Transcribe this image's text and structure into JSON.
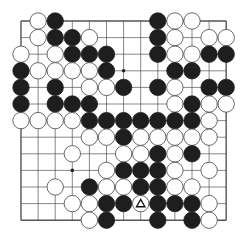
{
  "board": {
    "size": 13,
    "origin_x": 21,
    "origin_y": 21,
    "spacing_x": 17.1,
    "spacing_y": 16.6,
    "stone_radius": 8.2,
    "colors": {
      "line": "#555555",
      "black": "#1e1e1e",
      "white": "#ffffff",
      "white_stroke": "#444444",
      "background": "#ffffff"
    },
    "star_points": [
      [
        3,
        6
      ],
      [
        9,
        3
      ]
    ],
    "marked": {
      "row": 11,
      "col": 7,
      "mark": "triangle"
    },
    "stones": [
      {
        "r": 0,
        "c": 1,
        "color": "W"
      },
      {
        "r": 0,
        "c": 2,
        "color": "B"
      },
      {
        "r": 0,
        "c": 8,
        "color": "B"
      },
      {
        "r": 0,
        "c": 9,
        "color": "W"
      },
      {
        "r": 0,
        "c": 10,
        "color": "W"
      },
      {
        "r": 1,
        "c": 1,
        "color": "W"
      },
      {
        "r": 1,
        "c": 2,
        "color": "B"
      },
      {
        "r": 1,
        "c": 3,
        "color": "B"
      },
      {
        "r": 1,
        "c": 4,
        "color": "W"
      },
      {
        "r": 1,
        "c": 8,
        "color": "B"
      },
      {
        "r": 1,
        "c": 9,
        "color": "W"
      },
      {
        "r": 1,
        "c": 11,
        "color": "W"
      },
      {
        "r": 1,
        "c": 12,
        "color": "W"
      },
      {
        "r": 2,
        "c": 0,
        "color": "W"
      },
      {
        "r": 2,
        "c": 2,
        "color": "W"
      },
      {
        "r": 2,
        "c": 3,
        "color": "B"
      },
      {
        "r": 2,
        "c": 4,
        "color": "B"
      },
      {
        "r": 2,
        "c": 5,
        "color": "B"
      },
      {
        "r": 2,
        "c": 8,
        "color": "B"
      },
      {
        "r": 2,
        "c": 9,
        "color": "W"
      },
      {
        "r": 2,
        "c": 10,
        "color": "W"
      },
      {
        "r": 2,
        "c": 11,
        "color": "B"
      },
      {
        "r": 2,
        "c": 12,
        "color": "B"
      },
      {
        "r": 3,
        "c": 0,
        "color": "B"
      },
      {
        "r": 3,
        "c": 1,
        "color": "W"
      },
      {
        "r": 3,
        "c": 2,
        "color": "W"
      },
      {
        "r": 3,
        "c": 3,
        "color": "W"
      },
      {
        "r": 3,
        "c": 4,
        "color": "W"
      },
      {
        "r": 3,
        "c": 5,
        "color": "B"
      },
      {
        "r": 3,
        "c": 9,
        "color": "B"
      },
      {
        "r": 3,
        "c": 10,
        "color": "B"
      },
      {
        "r": 4,
        "c": 0,
        "color": "B"
      },
      {
        "r": 4,
        "c": 2,
        "color": "B"
      },
      {
        "r": 4,
        "c": 4,
        "color": "W"
      },
      {
        "r": 4,
        "c": 5,
        "color": "W"
      },
      {
        "r": 4,
        "c": 6,
        "color": "B"
      },
      {
        "r": 4,
        "c": 8,
        "color": "B"
      },
      {
        "r": 4,
        "c": 9,
        "color": "W"
      },
      {
        "r": 4,
        "c": 11,
        "color": "B"
      },
      {
        "r": 4,
        "c": 12,
        "color": "B"
      },
      {
        "r": 5,
        "c": 0,
        "color": "B"
      },
      {
        "r": 5,
        "c": 2,
        "color": "B"
      },
      {
        "r": 5,
        "c": 3,
        "color": "B"
      },
      {
        "r": 5,
        "c": 4,
        "color": "B"
      },
      {
        "r": 5,
        "c": 9,
        "color": "W"
      },
      {
        "r": 5,
        "c": 10,
        "color": "B"
      },
      {
        "r": 5,
        "c": 11,
        "color": "W"
      },
      {
        "r": 5,
        "c": 12,
        "color": "W"
      },
      {
        "r": 6,
        "c": 0,
        "color": "W"
      },
      {
        "r": 6,
        "c": 1,
        "color": "W"
      },
      {
        "r": 6,
        "c": 2,
        "color": "W"
      },
      {
        "r": 6,
        "c": 3,
        "color": "W"
      },
      {
        "r": 6,
        "c": 4,
        "color": "B"
      },
      {
        "r": 6,
        "c": 5,
        "color": "B"
      },
      {
        "r": 6,
        "c": 6,
        "color": "B"
      },
      {
        "r": 6,
        "c": 7,
        "color": "B"
      },
      {
        "r": 6,
        "c": 8,
        "color": "B"
      },
      {
        "r": 6,
        "c": 9,
        "color": "B"
      },
      {
        "r": 6,
        "c": 10,
        "color": "B"
      },
      {
        "r": 6,
        "c": 11,
        "color": "W"
      },
      {
        "r": 7,
        "c": 4,
        "color": "W"
      },
      {
        "r": 7,
        "c": 5,
        "color": "W"
      },
      {
        "r": 7,
        "c": 6,
        "color": "B"
      },
      {
        "r": 7,
        "c": 7,
        "color": "W"
      },
      {
        "r": 7,
        "c": 8,
        "color": "W"
      },
      {
        "r": 7,
        "c": 9,
        "color": "W"
      },
      {
        "r": 7,
        "c": 10,
        "color": "W"
      },
      {
        "r": 7,
        "c": 11,
        "color": "W"
      },
      {
        "r": 8,
        "c": 3,
        "color": "W"
      },
      {
        "r": 8,
        "c": 6,
        "color": "W"
      },
      {
        "r": 8,
        "c": 7,
        "color": "W"
      },
      {
        "r": 8,
        "c": 8,
        "color": "B"
      },
      {
        "r": 8,
        "c": 9,
        "color": "W"
      },
      {
        "r": 8,
        "c": 10,
        "color": "B"
      },
      {
        "r": 9,
        "c": 5,
        "color": "W"
      },
      {
        "r": 9,
        "c": 6,
        "color": "B"
      },
      {
        "r": 9,
        "c": 7,
        "color": "B"
      },
      {
        "r": 9,
        "c": 8,
        "color": "B"
      },
      {
        "r": 9,
        "c": 9,
        "color": "W"
      },
      {
        "r": 9,
        "c": 11,
        "color": "W"
      },
      {
        "r": 10,
        "c": 2,
        "color": "W"
      },
      {
        "r": 10,
        "c": 4,
        "color": "B"
      },
      {
        "r": 10,
        "c": 5,
        "color": "W"
      },
      {
        "r": 10,
        "c": 6,
        "color": "W"
      },
      {
        "r": 10,
        "c": 7,
        "color": "B"
      },
      {
        "r": 10,
        "c": 8,
        "color": "B"
      },
      {
        "r": 10,
        "c": 9,
        "color": "W"
      },
      {
        "r": 10,
        "c": 10,
        "color": "W"
      },
      {
        "r": 11,
        "c": 3,
        "color": "W"
      },
      {
        "r": 11,
        "c": 4,
        "color": "W"
      },
      {
        "r": 11,
        "c": 5,
        "color": "B"
      },
      {
        "r": 11,
        "c": 6,
        "color": "B"
      },
      {
        "r": 11,
        "c": 7,
        "color": "W"
      },
      {
        "r": 11,
        "c": 8,
        "color": "B"
      },
      {
        "r": 11,
        "c": 9,
        "color": "B"
      },
      {
        "r": 11,
        "c": 10,
        "color": "B"
      },
      {
        "r": 11,
        "c": 11,
        "color": "W"
      },
      {
        "r": 12,
        "c": 4,
        "color": "W"
      },
      {
        "r": 12,
        "c": 5,
        "color": "B"
      },
      {
        "r": 12,
        "c": 8,
        "color": "B"
      },
      {
        "r": 12,
        "c": 10,
        "color": "B"
      },
      {
        "r": 12,
        "c": 11,
        "color": "W"
      }
    ]
  }
}
